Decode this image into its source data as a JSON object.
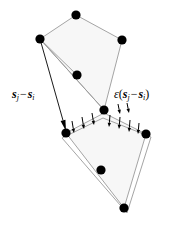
{
  "figure": {
    "background_color": "#ffffff",
    "width": 187,
    "height": 235
  },
  "style": {
    "polygon_fill": "#f7f7f7",
    "polygon_stroke": "#9a9a9a",
    "vertex_color": "#000000",
    "arrow_color": "#000000",
    "text_color": "#000000"
  },
  "labels": {
    "displacement": {
      "name": "s_j - s_i",
      "symbol_s": "s",
      "sub_j": "j",
      "minus": "−",
      "sub_i": "i"
    },
    "strain": {
      "name": "epsilon(s_j - s_i)",
      "epsilon": "ε",
      "open_paren": "(",
      "symbol_s": "s",
      "sub_j": "j",
      "minus": "−",
      "sub_i": "i",
      "close_paren": ")"
    }
  },
  "chart_data": {
    "type": "diagram",
    "shapes": [
      {
        "name": "upper-polygon",
        "role": "reference-cell",
        "fill": "#f7f7f7",
        "stroke": "#9a9a9a",
        "points": [
          [
            40,
            39
          ],
          [
            76,
            15
          ],
          [
            122,
            40
          ],
          [
            104,
            110
          ]
        ]
      },
      {
        "name": "lower-polygon-inner",
        "role": "deformed-cell",
        "fill": "#f7f7f7",
        "stroke": "#9a9a9a",
        "points": [
          [
            66,
            133
          ],
          [
            104,
            113
          ],
          [
            146,
            134
          ],
          [
            124,
            208
          ]
        ]
      },
      {
        "name": "lower-polygon-outer",
        "role": "undeformed-outline",
        "fill": "none",
        "stroke": "#9a9a9a",
        "points": [
          [
            62,
            138
          ],
          [
            103,
            118
          ],
          [
            151,
            137
          ],
          [
            127,
            213
          ]
        ]
      }
    ],
    "vertices": [
      {
        "name": "upper-top",
        "x": 76,
        "y": 15,
        "r": 4.6
      },
      {
        "name": "upper-left",
        "x": 40,
        "y": 39,
        "r": 4.6
      },
      {
        "name": "upper-right",
        "x": 122,
        "y": 40,
        "r": 4.6
      },
      {
        "name": "upper-interior",
        "x": 77,
        "y": 75,
        "r": 4.6
      },
      {
        "name": "shared-bottom",
        "x": 104,
        "y": 110,
        "r": 4.6
      },
      {
        "name": "lower-left",
        "x": 66,
        "y": 133,
        "r": 4.6
      },
      {
        "name": "lower-right",
        "x": 146,
        "y": 134,
        "r": 4.6
      },
      {
        "name": "lower-interior",
        "x": 101,
        "y": 170,
        "r": 4.6
      },
      {
        "name": "lower-bottom",
        "x": 124,
        "y": 208,
        "r": 4.6
      }
    ],
    "connector_lines": [
      {
        "name": "left-guide",
        "from": [
          40,
          39
        ],
        "to": [
          104,
          110
        ]
      },
      {
        "name": "interior-guide",
        "from": [
          40,
          39
        ],
        "to": [
          77,
          75
        ]
      }
    ],
    "main_arrow": {
      "name": "displacement-arrow",
      "from": [
        40,
        39
      ],
      "to": [
        66,
        131
      ],
      "head_length": 11,
      "head_width": 5
    },
    "strain_arrows": [
      {
        "from": [
          72,
          121
        ],
        "to": [
          74,
          133
        ]
      },
      {
        "from": [
          82,
          117
        ],
        "to": [
          84,
          129
        ]
      },
      {
        "from": [
          92,
          113
        ],
        "to": [
          94,
          125
        ]
      },
      {
        "from": [
          110,
          115
        ],
        "to": [
          109,
          127
        ]
      },
      {
        "from": [
          120,
          117
        ],
        "to": [
          119,
          129
        ]
      },
      {
        "from": [
          130,
          120
        ],
        "to": [
          129,
          132
        ]
      },
      {
        "from": [
          139,
          123
        ],
        "to": [
          138,
          134
        ]
      },
      {
        "from": [
          118,
          104
        ],
        "to": [
          120,
          114
        ]
      },
      {
        "from": [
          127,
          103
        ],
        "to": [
          129,
          113
        ]
      }
    ]
  }
}
